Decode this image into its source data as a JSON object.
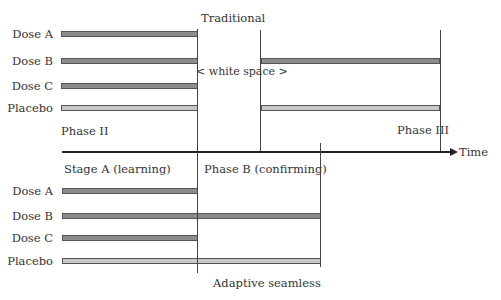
{
  "diagram": {
    "top_title": "Traditional",
    "bottom_title": "Adaptive seamless",
    "white_space_label": "< white space >",
    "axis_label": "Time",
    "traditional": {
      "phase_left": "Phase II",
      "phase_right": "Phase III",
      "rows": [
        {
          "label": "Dose A",
          "type": "dose",
          "segments": [
            "phase-ii"
          ]
        },
        {
          "label": "Dose B",
          "type": "dose",
          "segments": [
            "phase-ii",
            "phase-iii"
          ]
        },
        {
          "label": "Dose C",
          "type": "dose",
          "segments": [
            "phase-ii"
          ]
        },
        {
          "label": "Placebo",
          "type": "placebo",
          "segments": [
            "phase-ii",
            "phase-iii"
          ]
        }
      ]
    },
    "adaptive": {
      "stage_a": "Stage A (learning)",
      "stage_b": "Phase B (confirming)",
      "rows": [
        {
          "label": "Dose A",
          "type": "dose",
          "segments": [
            "stage-a"
          ]
        },
        {
          "label": "Dose B",
          "type": "dose",
          "segments": [
            "stage-a",
            "stage-b"
          ]
        },
        {
          "label": "Dose C",
          "type": "dose",
          "segments": [
            "stage-a"
          ]
        },
        {
          "label": "Placebo",
          "type": "placebo",
          "segments": [
            "stage-a",
            "stage-b"
          ]
        }
      ]
    },
    "colors": {
      "dose_bar": "#8c8c8c",
      "placebo_bar": "#c8c8c8",
      "lines": "#444444"
    }
  }
}
